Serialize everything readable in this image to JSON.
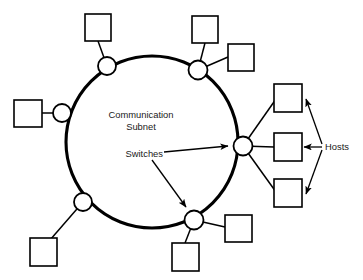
{
  "diagram": {
    "type": "network-ring-topology",
    "canvas": {
      "width": 363,
      "height": 280,
      "background": "#ffffff"
    },
    "colors": {
      "stroke": "#000000",
      "fill": "#ffffff",
      "text": "#1a1a1a",
      "background": "#ffffff"
    },
    "labels": {
      "subnet_line1": "Communication",
      "subnet_line2": "Subnet",
      "switches": "Switches",
      "hosts": "Hosts"
    },
    "ring": {
      "center_x": 152,
      "center_y": 142,
      "radius": 86,
      "stroke_width": 3.1
    },
    "switches": [
      {
        "id": "switch-top-left",
        "cx": 107,
        "cy": 66,
        "r": 9
      },
      {
        "id": "switch-top-right",
        "cx": 198,
        "cy": 70,
        "r": 9.5
      },
      {
        "id": "switch-left",
        "cx": 62,
        "cy": 113,
        "r": 9
      },
      {
        "id": "switch-bottom-left",
        "cx": 83,
        "cy": 202,
        "r": 9
      },
      {
        "id": "switch-bottom-center",
        "cx": 194,
        "cy": 220,
        "r": 9.5
      },
      {
        "id": "switch-right",
        "cx": 243,
        "cy": 146,
        "r": 9.5
      }
    ],
    "hosts": [
      {
        "id": "host-top-1",
        "x": 85,
        "y": 14,
        "w": 26,
        "h": 27
      },
      {
        "id": "host-top-2",
        "x": 192,
        "y": 16,
        "w": 26,
        "h": 27
      },
      {
        "id": "host-top-3",
        "x": 228,
        "y": 44,
        "w": 26,
        "h": 27
      },
      {
        "id": "host-left-1",
        "x": 14,
        "y": 100,
        "w": 28,
        "h": 27
      },
      {
        "id": "host-bottom-1",
        "x": 30,
        "y": 238,
        "w": 27,
        "h": 28
      },
      {
        "id": "host-bottom-2",
        "x": 172,
        "y": 243,
        "w": 27,
        "h": 28
      },
      {
        "id": "host-bottom-3",
        "x": 225,
        "y": 215,
        "w": 27,
        "h": 27
      },
      {
        "id": "host-right-1",
        "x": 274,
        "y": 84,
        "w": 28,
        "h": 28
      },
      {
        "id": "host-right-2",
        "x": 274,
        "y": 133,
        "w": 28,
        "h": 28
      },
      {
        "id": "host-right-3",
        "x": 274,
        "y": 179,
        "w": 28,
        "h": 28
      }
    ],
    "annotations": [
      {
        "id": "switches-arrow-right",
        "from_label": "Switches",
        "to_node": "switch-right"
      },
      {
        "id": "switches-arrow-down",
        "from_label": "Switches",
        "to_node": "switch-bottom-center"
      },
      {
        "id": "hosts-arrow-top",
        "from_label": "Hosts",
        "to_node": "host-right-1"
      },
      {
        "id": "hosts-arrow-middle",
        "from_label": "Hosts",
        "to_node": "host-right-2"
      },
      {
        "id": "hosts-arrow-bottom",
        "from_label": "Hosts",
        "to_node": "host-right-3"
      }
    ]
  }
}
